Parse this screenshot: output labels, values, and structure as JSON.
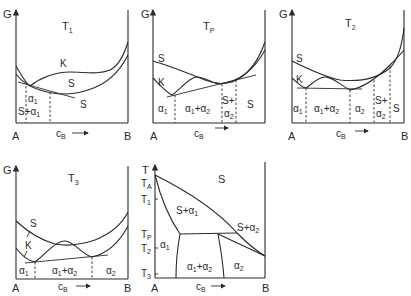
{
  "figure": {
    "axis_y_label": "G",
    "axis_x_label": "c",
    "axis_x_label_sub": "B",
    "left_component": "A",
    "right_component": "B",
    "panels": [
      {
        "id": "T1",
        "temp_label": "T",
        "temp_sub": "1",
        "curve_labels": [
          "K",
          "S"
        ],
        "regions": [
          {
            "label": "α",
            "sub": "1"
          },
          {
            "label": "S+α",
            "sub": "1"
          },
          {
            "label": "S"
          }
        ]
      },
      {
        "id": "Tp",
        "temp_label": "T",
        "temp_sub": "P",
        "curve_labels": [
          "S",
          "K"
        ],
        "regions": [
          {
            "label": "α",
            "sub": "1"
          },
          {
            "label": "α1+α2"
          },
          {
            "label": "S+"
          },
          {
            "label": "α",
            "sub": "2"
          },
          {
            "label": "S"
          }
        ]
      },
      {
        "id": "T2",
        "temp_label": "T",
        "temp_sub": "2",
        "curve_labels": [
          "S",
          "K"
        ],
        "regions": [
          {
            "label": "α",
            "sub": "1"
          },
          {
            "label": "α1+α2"
          },
          {
            "label": "α",
            "sub": "2"
          },
          {
            "label": "S+"
          },
          {
            "label": "α",
            "sub": "2"
          },
          {
            "label": "S"
          }
        ]
      },
      {
        "id": "T3",
        "temp_label": "T",
        "temp_sub": "3",
        "curve_labels": [
          "S",
          "K"
        ],
        "regions": [
          {
            "label": "α",
            "sub": "1"
          },
          {
            "label": "α1+α2"
          },
          {
            "label": "α",
            "sub": "2"
          }
        ]
      }
    ],
    "phase_diagram": {
      "axis_y_label": "T",
      "y_ticks": [
        {
          "label": "T",
          "sub": "A"
        },
        {
          "label": "T",
          "sub": "1"
        },
        {
          "label": "T",
          "sub": "P"
        },
        {
          "label": "T",
          "sub": "2"
        },
        {
          "label": "T",
          "sub": "3"
        }
      ],
      "regions": [
        "S",
        "S+α1",
        "S+α2",
        "α1",
        "α1+α2",
        "α2"
      ]
    }
  }
}
